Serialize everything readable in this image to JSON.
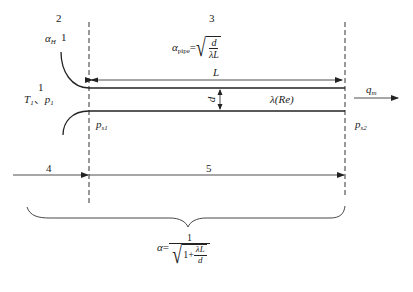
{
  "diagram": {
    "type": "pipe-flow-schematic",
    "region_labels": {
      "r2": "2",
      "r1_top": "1",
      "r1_left": "1",
      "r3": "3",
      "r4": "4",
      "r5": "5"
    },
    "inlet": {
      "alpha_symbol": "α",
      "alpha_sub": "H",
      "state_T": "T",
      "state_T_sub": "1",
      "separator": "、",
      "state_p": "p",
      "state_p_sub": "1"
    },
    "pipe": {
      "length_label": "L",
      "diameter_label": "d",
      "friction_label": "λ(Re)",
      "pressure_in": "p",
      "pressure_in_sub": "s1",
      "pressure_out": "p",
      "pressure_out_sub": "s2"
    },
    "outlet": {
      "flow_symbol": "q",
      "flow_sub": "m"
    },
    "formulas": {
      "alpha_pipe": {
        "lhs": "α",
        "lhs_sub": "pipe",
        "equals": "=",
        "numerator": "d",
        "denominator": "λL"
      },
      "alpha_total": {
        "lhs": "α",
        "equals": "=",
        "numerator": "1",
        "inner_one": "1+",
        "inner_num": "λL",
        "inner_den": "d"
      }
    }
  }
}
